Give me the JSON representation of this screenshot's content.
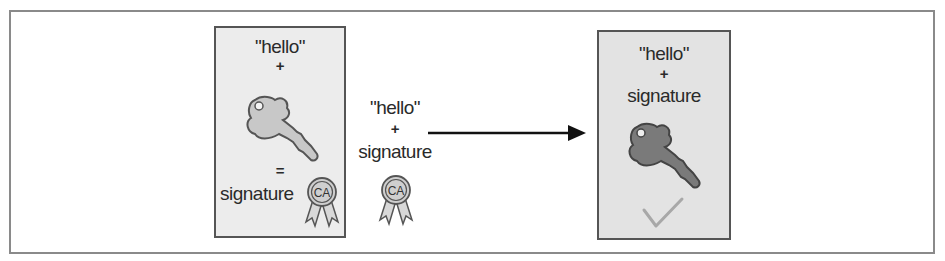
{
  "diagram": {
    "left_card": {
      "message": "\"hello\"",
      "plus": "+",
      "key_icon": "private-key-icon",
      "equals": "=",
      "result": "signature",
      "badge": {
        "icon": "ca-badge-icon",
        "label": "CA"
      }
    },
    "middle": {
      "message": "\"hello\"",
      "plus": "+",
      "payload": "signature",
      "badge": {
        "icon": "ca-badge-icon",
        "label": "CA"
      },
      "arrow": "arrow-right-icon"
    },
    "right_card": {
      "message": "\"hello\"",
      "plus": "+",
      "payload": "signature",
      "key_icon": "public-key-icon",
      "status_icon": "checkmark-icon"
    },
    "colors": {
      "left_card_bg": "#ececec",
      "right_card_bg": "#e3e3e3",
      "light_key": "#c8c8c8",
      "dark_key": "#7a7a7a",
      "badge_fill": "#cfcfcf",
      "checkmark": "#a8a8a8",
      "outline": "#555555"
    }
  }
}
